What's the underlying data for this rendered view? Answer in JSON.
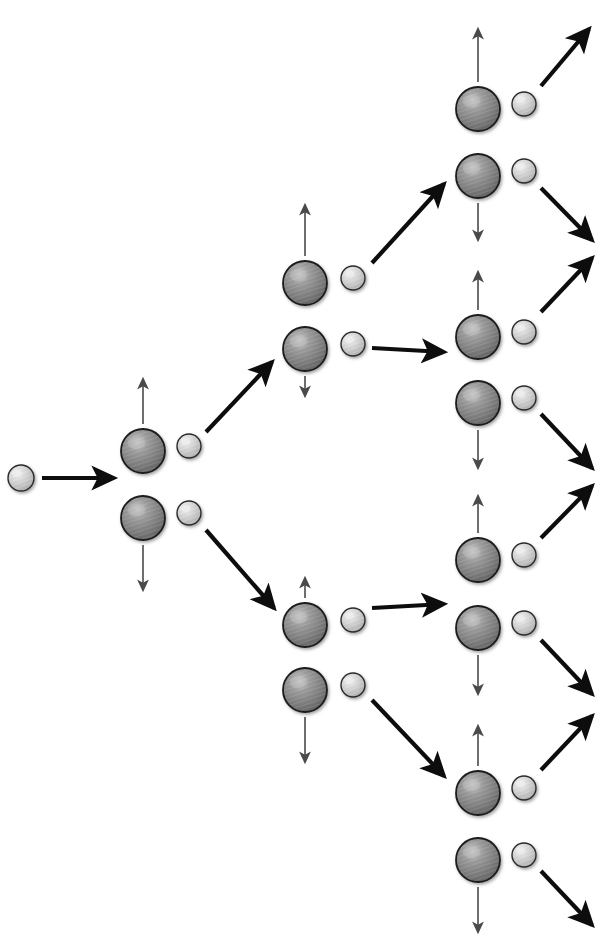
{
  "figure": {
    "width": 596,
    "height": 943,
    "background": "#ffffff"
  },
  "style": {
    "nucleus_fill_dark": "#6f6f6f",
    "nucleus_fill_mid": "#8d8d8d",
    "nucleus_highlight": "#c4c4c4",
    "nucleus_stroke": "#1a1a1a",
    "neutron_fill": "#c9c9c9",
    "neutron_highlight": "#eeeeee",
    "neutron_stroke": "#2b2b2b",
    "thick_arrow_color": "#0d0d0d",
    "thin_arrow_color": "#4a4a4a",
    "nucleus_radius": 22,
    "neutron_radius": 12,
    "small_neutron_radius": 13,
    "thick_arrow_width": 4.2,
    "thin_arrow_width": 1.6
  },
  "nodes": [
    {
      "name": "incident-neutron",
      "kind": "neutron",
      "cx": 21,
      "cy": 478,
      "r": 13
    },
    {
      "name": "nucleus-gen1-upper",
      "kind": "nucleus",
      "cx": 143,
      "cy": 451,
      "r": 22
    },
    {
      "name": "neutron-gen1-upper",
      "kind": "neutron",
      "cx": 189,
      "cy": 446,
      "r": 12
    },
    {
      "name": "nucleus-gen1-lower",
      "kind": "nucleus",
      "cx": 143,
      "cy": 518,
      "r": 22
    },
    {
      "name": "neutron-gen1-lower",
      "kind": "neutron",
      "cx": 189,
      "cy": 513,
      "r": 12
    },
    {
      "name": "nucleus-gen2-top-upper",
      "kind": "nucleus",
      "cx": 305,
      "cy": 283,
      "r": 22
    },
    {
      "name": "neutron-gen2-top-upper",
      "kind": "neutron",
      "cx": 353,
      "cy": 278,
      "r": 12
    },
    {
      "name": "nucleus-gen2-top-lower",
      "kind": "nucleus",
      "cx": 305,
      "cy": 349,
      "r": 22
    },
    {
      "name": "neutron-gen2-top-lower",
      "kind": "neutron",
      "cx": 353,
      "cy": 344,
      "r": 12
    },
    {
      "name": "nucleus-gen2-bot-upper",
      "kind": "nucleus",
      "cx": 305,
      "cy": 625,
      "r": 22
    },
    {
      "name": "neutron-gen2-bot-upper",
      "kind": "neutron",
      "cx": 353,
      "cy": 620,
      "r": 12
    },
    {
      "name": "nucleus-gen2-bot-lower",
      "kind": "nucleus",
      "cx": 305,
      "cy": 690,
      "r": 22
    },
    {
      "name": "neutron-gen2-bot-lower",
      "kind": "neutron",
      "cx": 353,
      "cy": 685,
      "r": 12
    },
    {
      "name": "nucleus-gen3-a-upper",
      "kind": "nucleus",
      "cx": 478,
      "cy": 109,
      "r": 22
    },
    {
      "name": "neutron-gen3-a-upper",
      "kind": "neutron",
      "cx": 524,
      "cy": 104,
      "r": 12
    },
    {
      "name": "nucleus-gen3-a-lower",
      "kind": "nucleus",
      "cx": 478,
      "cy": 176,
      "r": 22
    },
    {
      "name": "neutron-gen3-a-lower",
      "kind": "neutron",
      "cx": 524,
      "cy": 171,
      "r": 12
    },
    {
      "name": "nucleus-gen3-b-upper",
      "kind": "nucleus",
      "cx": 478,
      "cy": 337,
      "r": 22
    },
    {
      "name": "neutron-gen3-b-upper",
      "kind": "neutron",
      "cx": 524,
      "cy": 332,
      "r": 12
    },
    {
      "name": "nucleus-gen3-b-lower",
      "kind": "nucleus",
      "cx": 478,
      "cy": 403,
      "r": 22
    },
    {
      "name": "neutron-gen3-b-lower",
      "kind": "neutron",
      "cx": 524,
      "cy": 398,
      "r": 12
    },
    {
      "name": "nucleus-gen3-c-upper",
      "kind": "nucleus",
      "cx": 478,
      "cy": 560,
      "r": 22
    },
    {
      "name": "neutron-gen3-c-upper",
      "kind": "neutron",
      "cx": 524,
      "cy": 555,
      "r": 12
    },
    {
      "name": "nucleus-gen3-c-lower",
      "kind": "nucleus",
      "cx": 478,
      "cy": 628,
      "r": 22
    },
    {
      "name": "neutron-gen3-c-lower",
      "kind": "neutron",
      "cx": 524,
      "cy": 623,
      "r": 12
    },
    {
      "name": "nucleus-gen3-d-upper",
      "kind": "nucleus",
      "cx": 478,
      "cy": 793,
      "r": 22
    },
    {
      "name": "neutron-gen3-d-upper",
      "kind": "neutron",
      "cx": 524,
      "cy": 788,
      "r": 12
    },
    {
      "name": "nucleus-gen3-d-lower",
      "kind": "nucleus",
      "cx": 478,
      "cy": 860,
      "r": 22
    },
    {
      "name": "neutron-gen3-d-lower",
      "kind": "neutron",
      "cx": 524,
      "cy": 855,
      "r": 12
    }
  ],
  "thick_arrows": [
    {
      "name": "arrow-incident-to-gen1",
      "x1": 42,
      "y1": 478,
      "x2": 114,
      "y2": 478
    },
    {
      "name": "arrow-gen1-upper-to-gen2-top",
      "x1": 206,
      "y1": 432,
      "x2": 272,
      "y2": 362
    },
    {
      "name": "arrow-gen1-lower-to-gen2-bot",
      "x1": 206,
      "y1": 530,
      "x2": 274,
      "y2": 608
    },
    {
      "name": "arrow-gen2-top-up-to-gen3-a",
      "x1": 372,
      "y1": 263,
      "x2": 444,
      "y2": 184
    },
    {
      "name": "arrow-gen2-top-lo-to-gen3-b",
      "x1": 372,
      "y1": 348,
      "x2": 444,
      "y2": 352
    },
    {
      "name": "arrow-gen2-bot-up-to-gen3-c",
      "x1": 372,
      "y1": 608,
      "x2": 444,
      "y2": 604
    },
    {
      "name": "arrow-gen2-bot-lo-to-gen3-d",
      "x1": 372,
      "y1": 700,
      "x2": 444,
      "y2": 776
    },
    {
      "name": "arrow-gen3-a-upper-escape",
      "x1": 541,
      "y1": 86,
      "x2": 589,
      "y2": 29
    },
    {
      "name": "arrow-gen3-a-lower-escape",
      "x1": 541,
      "y1": 188,
      "x2": 592,
      "y2": 240
    },
    {
      "name": "arrow-gen3-b-upper-escape",
      "x1": 541,
      "y1": 312,
      "x2": 592,
      "y2": 258
    },
    {
      "name": "arrow-gen3-b-lower-escape",
      "x1": 541,
      "y1": 414,
      "x2": 592,
      "y2": 468
    },
    {
      "name": "arrow-gen3-c-upper-escape",
      "x1": 541,
      "y1": 538,
      "x2": 592,
      "y2": 486
    },
    {
      "name": "arrow-gen3-c-lower-escape",
      "x1": 541,
      "y1": 640,
      "x2": 592,
      "y2": 694
    },
    {
      "name": "arrow-gen3-d-upper-escape",
      "x1": 541,
      "y1": 770,
      "x2": 592,
      "y2": 716
    },
    {
      "name": "arrow-gen3-d-lower-escape",
      "x1": 541,
      "y1": 871,
      "x2": 592,
      "y2": 925
    }
  ],
  "thin_arrows": [
    {
      "name": "recoil-gen1-upper-up",
      "x1": 143,
      "y1": 424,
      "x2": 143,
      "y2": 379
    },
    {
      "name": "recoil-gen1-lower-down",
      "x1": 143,
      "y1": 545,
      "x2": 143,
      "y2": 590
    },
    {
      "name": "recoil-gen2-top-up",
      "x1": 305,
      "y1": 256,
      "x2": 305,
      "y2": 205
    },
    {
      "name": "recoil-gen2-top-down",
      "x1": 305,
      "y1": 376,
      "x2": 305,
      "y2": 396
    },
    {
      "name": "recoil-gen2-bot-up",
      "x1": 305,
      "y1": 598,
      "x2": 305,
      "y2": 578
    },
    {
      "name": "recoil-gen2-bot-down",
      "x1": 305,
      "y1": 717,
      "x2": 305,
      "y2": 762
    },
    {
      "name": "recoil-gen3-a-up",
      "x1": 478,
      "y1": 82,
      "x2": 478,
      "y2": 29
    },
    {
      "name": "recoil-gen3-a-down",
      "x1": 478,
      "y1": 203,
      "x2": 478,
      "y2": 240
    },
    {
      "name": "recoil-gen3-b-up",
      "x1": 478,
      "y1": 310,
      "x2": 478,
      "y2": 272
    },
    {
      "name": "recoil-gen3-b-down",
      "x1": 478,
      "y1": 430,
      "x2": 478,
      "y2": 468
    },
    {
      "name": "recoil-gen3-c-up",
      "x1": 478,
      "y1": 533,
      "x2": 478,
      "y2": 496
    },
    {
      "name": "recoil-gen3-c-down",
      "x1": 478,
      "y1": 655,
      "x2": 478,
      "y2": 694
    },
    {
      "name": "recoil-gen3-d-up",
      "x1": 478,
      "y1": 766,
      "x2": 478,
      "y2": 726
    },
    {
      "name": "recoil-gen3-d-down",
      "x1": 478,
      "y1": 887,
      "x2": 478,
      "y2": 932
    }
  ]
}
